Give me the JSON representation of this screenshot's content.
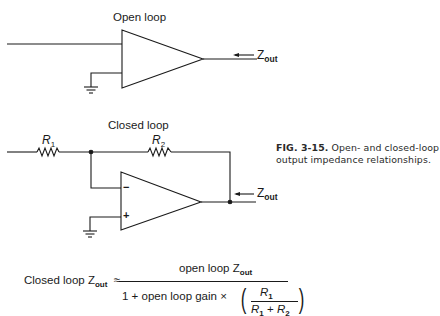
{
  "figure": {
    "open_loop": {
      "title": "Open loop",
      "zout_label": "Z",
      "zout_sub": "out"
    },
    "closed_loop": {
      "title": "Closed loop",
      "r1_label": "R",
      "r1_sub": "1",
      "r2_label": "R",
      "r2_sub": "2",
      "minus_sign": "−",
      "plus_sign": "+",
      "zout_label": "Z",
      "zout_sub": "out"
    },
    "caption": {
      "number": "FIG. 3-15.",
      "text": "Open- and closed-loop output impedance relationships."
    },
    "formula": {
      "lhs": "Closed loop Z",
      "lhs_sub": "out",
      "approx": "≈",
      "numerator": "open loop Z",
      "numerator_sub": "out",
      "denominator": "1 +  open loop gain ×",
      "ratio_num": "R",
      "ratio_num_sub": "1",
      "ratio_den_a": "R",
      "ratio_den_a_sub": "1",
      "ratio_den_plus": " + ",
      "ratio_den_b": "R",
      "ratio_den_b_sub": "2"
    }
  }
}
